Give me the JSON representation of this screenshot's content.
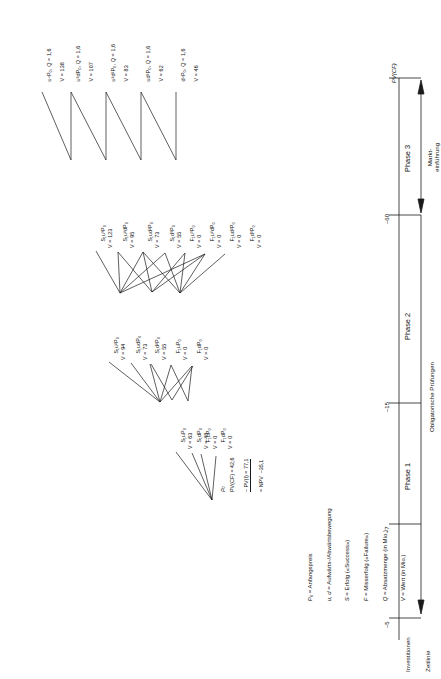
{
  "figure": {
    "orientation": "rotated-90",
    "type": "binomial-decision-tree",
    "ink_color": "#1a1a1a"
  },
  "timeline": {
    "axis_label": "Zeitlinie",
    "investment_label": "Investitionen",
    "pv_label": "PV(CF)",
    "ticks": [
      "–5",
      "–7",
      "–15",
      "–60"
    ],
    "phases": [
      "Phase 1",
      "Phase 2",
      "Phase 3"
    ],
    "brace_left": "Obligatorische Prüfungen",
    "brace_right": "Markt-\neinführung"
  },
  "root": {
    "symbol": "P",
    "symbol_sub": "0",
    "lines": [
      "PV(CF) = 42,6",
      "– PV(I) = 77,1",
      "= NPV  –35,1"
    ]
  },
  "legend": [
    {
      "sym": "P",
      "sub": "0",
      "text": "= Anfangspreis"
    },
    {
      "sym": "u, d",
      "sub": "",
      "text": "= Aufwärts-/Abwärtsbewegung"
    },
    {
      "sym": "S",
      "sub": "",
      "text": "= Erfolg («Success»)"
    },
    {
      "sym": "F",
      "sub": "",
      "text": "= Misserfolg («Failure»)"
    },
    {
      "sym": "Q",
      "sub": "",
      "text": "= Absatzmenge (in Mio.)"
    },
    {
      "sym": "V",
      "sub": "",
      "text": "= Wert (in Mio.)"
    }
  ],
  "phase1_nodes": [
    {
      "label": "S₁uP₀",
      "value": "V = 63"
    },
    {
      "label": "S₁dP₀",
      "value": "V = 48"
    },
    {
      "label": "F₁uP₀",
      "value": "V = 0"
    },
    {
      "label": "F₁dP₀",
      "value": "V = 0"
    }
  ],
  "phase2_nodes": [
    {
      "label": "S₁u²P₀",
      "value": "V = 94"
    },
    {
      "label": "S₁udP₀",
      "value": "V = 73"
    },
    {
      "label": "S₁d²P₀",
      "value": "V = 55"
    },
    {
      "label": "F₁uP₀",
      "value": "V = 0"
    },
    {
      "label": "F₁dP₀",
      "value": "V = 0"
    }
  ],
  "phase3_nodes": [
    {
      "label": "S₁u³P₀",
      "value": "V = 123"
    },
    {
      "label": "S₁u²dP₀",
      "value": "V = 95"
    },
    {
      "label": "S₁ud²P₀",
      "value": "V = 73"
    },
    {
      "label": "S₁d³P₀",
      "value": "V = 55"
    },
    {
      "label": "F₁u³P₀",
      "value": "V = 0"
    },
    {
      "label": "F₁u²dP₀",
      "value": "V = 0"
    },
    {
      "label": "F₁ud²P₀",
      "value": "V = 0"
    },
    {
      "label": "F₁d³P₀",
      "value": "V = 0"
    }
  ],
  "payoff_nodes": [
    {
      "label": "u⁴P₀",
      "q": "Q = 1,6",
      "value": "V = 138"
    },
    {
      "label": "u³dP₀",
      "q": "Q = 1,6",
      "value": "V = 107"
    },
    {
      "label": "u²d²P₀",
      "q": "Q = 1,6",
      "value": "V = 83"
    },
    {
      "label": "ud³P₀",
      "q": "Q = 1,6",
      "value": "V = 62"
    },
    {
      "label": "d⁴P₀",
      "q": "Q = 1,6",
      "value": "V = 46"
    }
  ]
}
